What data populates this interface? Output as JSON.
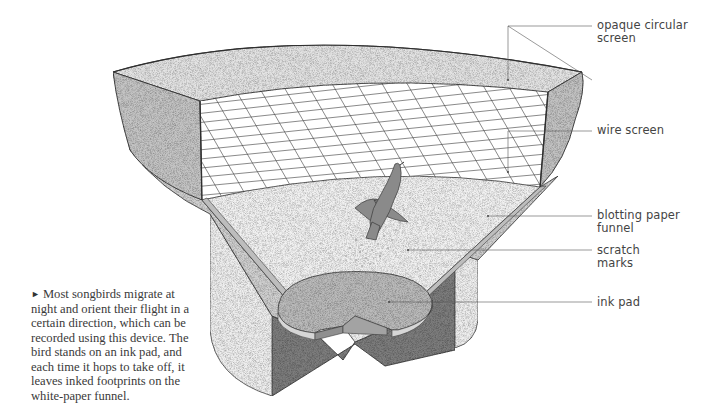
{
  "diagram": {
    "labels": [
      {
        "id": "opaque-screen",
        "text": "opaque circular\nscreen"
      },
      {
        "id": "wire-screen",
        "text": "wire screen"
      },
      {
        "id": "blotting-paper",
        "text": "blotting paper\nfunnel"
      },
      {
        "id": "scratch-marks",
        "text": "scratch\nmarks"
      },
      {
        "id": "ink-pad",
        "text": "ink pad"
      }
    ],
    "caption": {
      "marker": "►",
      "text": "Most songbirds migrate at night and orient their flight in a certain direction, which can be recorded using this device. The bird stands on an ink pad, and each time it hops to take off, it leaves inked footprints on the white-paper funnel."
    },
    "colors": {
      "leader_line": "#555555",
      "outline": "#3c3c3c",
      "wall_outer": "#c4c4c4",
      "wall_inner": "#e6e6e6",
      "funnel_paper": "#f3f3f3",
      "ink_pad": "#b9b9b9",
      "cylinder_inner": "#7d7d7d",
      "bird": "#8a8a8a"
    }
  }
}
